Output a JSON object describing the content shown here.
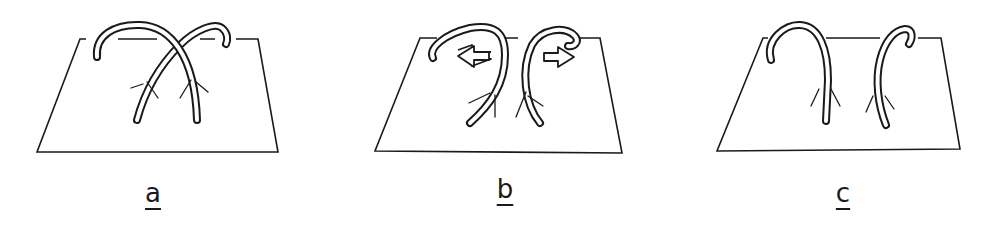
{
  "figure": {
    "panels": [
      {
        "id": "a",
        "label": "a",
        "description": "two crossing arched tubes rooted in a plane"
      },
      {
        "id": "b",
        "label": "b",
        "description": "arches separating, arrows pointing outward"
      },
      {
        "id": "c",
        "label": "c",
        "description": "two separate arched tubes rooted in a plane"
      }
    ],
    "colors": {
      "line": "#1a1a1a",
      "background": "#ffffff"
    }
  }
}
